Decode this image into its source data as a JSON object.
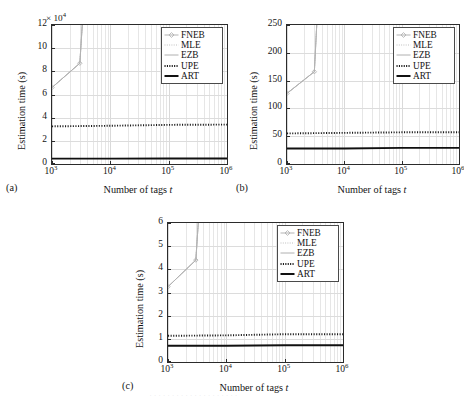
{
  "figure": {
    "panels": [
      {
        "tag": "(a)",
        "xlabel_prefix": "Number of tags ",
        "xlabel_var": "t",
        "ylabel": "Estimation time (s)",
        "multiplier": "× 10",
        "multiplier_exp": "4",
        "xticks": [
          "10",
          "10",
          "10",
          "10"
        ],
        "xtick_exps": [
          "3",
          "4",
          "5",
          "6"
        ],
        "yticks": [
          "0",
          "2",
          "4",
          "6",
          "8",
          "10",
          "12"
        ]
      },
      {
        "tag": "(b)",
        "xlabel_prefix": "Number of tags ",
        "xlabel_var": "t",
        "ylabel": "Estimation time (s)",
        "multiplier": "",
        "multiplier_exp": "",
        "xticks": [
          "10",
          "10",
          "10",
          "10"
        ],
        "xtick_exps": [
          "3",
          "4",
          "5",
          "6"
        ],
        "yticks": [
          "0",
          "50",
          "100",
          "150",
          "200",
          "250"
        ]
      },
      {
        "tag": "(c)",
        "xlabel_prefix": "Number of tags ",
        "xlabel_var": "t",
        "ylabel": "Estimation time (s)",
        "multiplier": "",
        "multiplier_exp": "",
        "xticks": [
          "10",
          "10",
          "10",
          "10"
        ],
        "xtick_exps": [
          "3",
          "4",
          "5",
          "6"
        ],
        "yticks": [
          "0",
          "1",
          "2",
          "3",
          "4",
          "5",
          "6"
        ]
      }
    ],
    "legend": {
      "entries": [
        {
          "label": "FNEB",
          "style": "line-marker",
          "color": "#b3b3b3"
        },
        {
          "label": "MLE",
          "style": "dotted-light",
          "color": "#bfbfbf"
        },
        {
          "label": "EZB",
          "style": "solid-light",
          "color": "#b0b0b0"
        },
        {
          "label": "UPE",
          "style": "dotted-bold",
          "color": "#1a1a1a"
        },
        {
          "label": "ART",
          "style": "solid-bold",
          "color": "#111111"
        }
      ]
    }
  },
  "chart_data": [
    {
      "id": "a",
      "type": "line",
      "title": "",
      "xlabel": "Number of tags t",
      "ylabel": "Estimation time (s)",
      "y_multiplier": 10000,
      "xscale": "log",
      "xlim": [
        1000,
        1000000
      ],
      "ylim": [
        0,
        120000
      ],
      "ytick_values": [
        0,
        20000,
        40000,
        60000,
        80000,
        100000,
        120000
      ],
      "xtick_values": [
        1000,
        10000,
        100000,
        1000000
      ],
      "grid": true,
      "legend_position": "top-right",
      "series": [
        {
          "name": "FNEB",
          "x": [
            1000,
            3000,
            3300
          ],
          "values": [
            66000,
            87000,
            120000
          ]
        },
        {
          "name": "MLE",
          "x": [
            1000,
            3000,
            3300
          ],
          "values": [
            66000,
            87000,
            120000
          ]
        },
        {
          "name": "EZB",
          "x": [
            1000,
            3000,
            3300
          ],
          "values": [
            66000,
            87000,
            120000
          ]
        },
        {
          "name": "UPE",
          "x": [
            1000,
            10000,
            100000,
            1000000
          ],
          "values": [
            32500,
            33000,
            33800,
            34000
          ]
        },
        {
          "name": "ART",
          "x": [
            1000,
            10000,
            100000,
            1000000
          ],
          "values": [
            4600,
            4600,
            4700,
            4700
          ]
        }
      ]
    },
    {
      "id": "b",
      "type": "line",
      "title": "",
      "xlabel": "Number of tags t",
      "ylabel": "Estimation time (s)",
      "y_multiplier": 1,
      "xscale": "log",
      "xlim": [
        1000,
        1000000
      ],
      "ylim": [
        0,
        250
      ],
      "ytick_values": [
        0,
        50,
        100,
        150,
        200,
        250
      ],
      "xtick_values": [
        1000,
        10000,
        100000,
        1000000
      ],
      "grid": true,
      "legend_position": "top-right",
      "series": [
        {
          "name": "FNEB",
          "x": [
            1000,
            3000,
            3300
          ],
          "values": [
            127,
            166,
            250
          ]
        },
        {
          "name": "MLE",
          "x": [
            1000,
            3000,
            3300
          ],
          "values": [
            127,
            166,
            250
          ]
        },
        {
          "name": "EZB",
          "x": [
            1000,
            3000,
            3300
          ],
          "values": [
            127,
            166,
            250
          ]
        },
        {
          "name": "UPE",
          "x": [
            1000,
            10000,
            100000,
            1000000
          ],
          "values": [
            55,
            56,
            57,
            57
          ]
        },
        {
          "name": "ART",
          "x": [
            1000,
            10000,
            100000,
            1000000
          ],
          "values": [
            28,
            28,
            29,
            29
          ]
        }
      ]
    },
    {
      "id": "c",
      "type": "line",
      "title": "",
      "xlabel": "Number of tags t",
      "ylabel": "Estimation time (s)",
      "y_multiplier": 1,
      "xscale": "log",
      "xlim": [
        1000,
        1000000
      ],
      "ylim": [
        0,
        6
      ],
      "ytick_values": [
        0,
        1,
        2,
        3,
        4,
        5,
        6
      ],
      "xtick_values": [
        1000,
        10000,
        100000,
        1000000
      ],
      "grid": true,
      "legend_position": "top-right",
      "series": [
        {
          "name": "FNEB",
          "x": [
            1000,
            3000,
            3300
          ],
          "values": [
            3.25,
            4.4,
            6.0
          ]
        },
        {
          "name": "MLE",
          "x": [
            1000,
            3000,
            3300
          ],
          "values": [
            3.25,
            4.4,
            6.0
          ]
        },
        {
          "name": "EZB",
          "x": [
            1000,
            3000,
            3300
          ],
          "values": [
            3.25,
            4.4,
            6.0
          ]
        },
        {
          "name": "UPE",
          "x": [
            1000,
            10000,
            100000,
            1000000
          ],
          "values": [
            1.13,
            1.15,
            1.2,
            1.2
          ]
        },
        {
          "name": "ART",
          "x": [
            1000,
            10000,
            100000,
            1000000
          ],
          "values": [
            0.7,
            0.7,
            0.72,
            0.72
          ]
        }
      ]
    }
  ]
}
